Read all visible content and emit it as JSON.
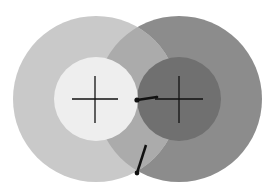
{
  "diagram": {
    "colors": {
      "background": "#ffffff",
      "left_outer": "#c9c9c9",
      "left_inner": "#eeeeee",
      "right_outer": "#8c8c8c",
      "right_inner": "#707070",
      "overlap": "#ababab",
      "lines": "#111111"
    },
    "left_target": {
      "cx": 96,
      "cy": 99,
      "outer_r": 83,
      "inner_r": 42,
      "cross": {
        "h": [
          72,
          118
        ],
        "v": [
          76,
          123
        ]
      }
    },
    "right_target": {
      "cx": 179,
      "cy": 99,
      "outer_r": 83,
      "inner_r": 42,
      "cross": {
        "h": [
          155,
          203
        ],
        "v": [
          76,
          123
        ]
      }
    },
    "segments": [
      {
        "from": [
          137,
          100
        ],
        "to": [
          157,
          97
        ],
        "dot_at_from": true
      },
      {
        "from": [
          137,
          173
        ],
        "to": [
          146,
          145
        ],
        "dot_at_from": true
      }
    ]
  }
}
